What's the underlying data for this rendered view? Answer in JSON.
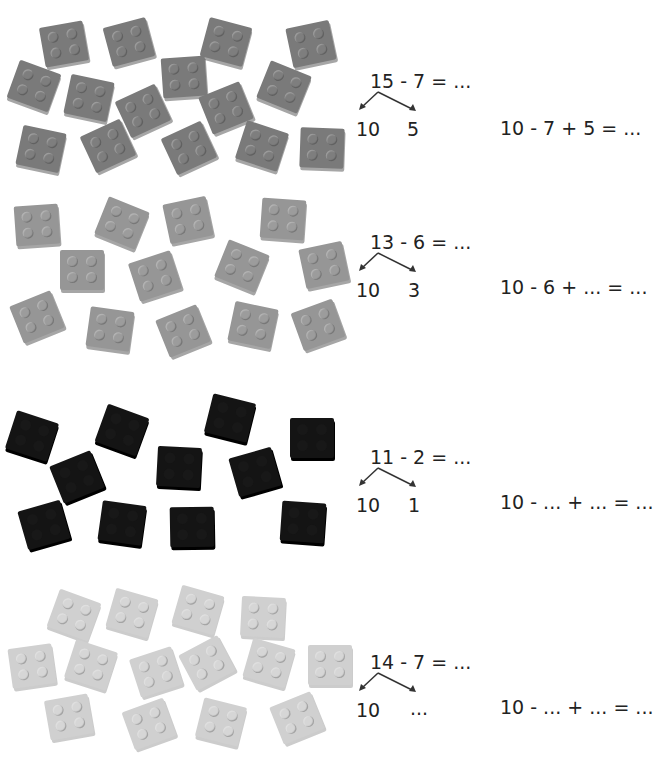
{
  "exercises": [
    {
      "brick_color": "#7a7a7a",
      "brick_count": 15,
      "problem": "15 - 7 = ...",
      "split_left": "10",
      "split_right": "5",
      "strategy": "10 - 7 + 5 = ..."
    },
    {
      "brick_color": "#969696",
      "brick_count": 13,
      "problem": "13 - 6 = ...",
      "split_left": "10",
      "split_right": "3",
      "strategy": "10 - 6 + ... = ..."
    },
    {
      "brick_color": "#141414",
      "brick_count": 11,
      "problem": "11 - 2 = ...",
      "split_left": "10",
      "split_right": "1",
      "strategy": "10 - ... + ... = ..."
    },
    {
      "brick_color": "#d0d0d0",
      "brick_count": 14,
      "problem": "14 - 7 = ...",
      "split_left": "10",
      "split_right": "...",
      "strategy": "10 - ... + ... = ..."
    }
  ]
}
